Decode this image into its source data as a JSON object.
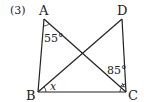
{
  "problem": {
    "number_label": "(3)"
  },
  "vertices": {
    "A": {
      "label": "A",
      "x": 44,
      "y": 19
    },
    "B": {
      "label": "B",
      "x": 38,
      "y": 92
    },
    "C": {
      "label": "C",
      "x": 126,
      "y": 92
    },
    "D": {
      "label": "D",
      "x": 122,
      "y": 19
    }
  },
  "segments": [
    "AB",
    "BC",
    "CD",
    "AC",
    "BD"
  ],
  "angles": {
    "at_A": {
      "label": "55°",
      "between": "BAC"
    },
    "at_C": {
      "label": "85°",
      "between": "ACD"
    },
    "at_B": {
      "label": "x",
      "between": "DBC"
    }
  },
  "colors": {
    "stroke": "#222222",
    "background": "#ffffff"
  }
}
